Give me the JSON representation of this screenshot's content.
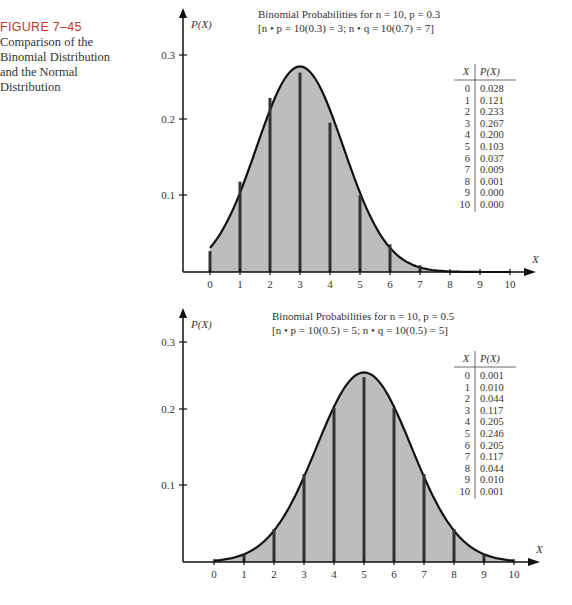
{
  "caption": {
    "figure_label": "FIGURE 7–45",
    "description_lines": [
      "Comparison of the",
      "Binomial Distribution",
      "and the Normal",
      "Distribution"
    ]
  },
  "colors": {
    "fill": "#bdbdbd",
    "line": "#111111",
    "bar": "#333333",
    "figure_label": "#c0392b"
  },
  "chart_data": [
    {
      "type": "bar",
      "title": "Binomial Probabilities for n = 10, p = 0.3",
      "subtitle": "[n • p = 10(0.3) = 3;  n • q = 10(0.7) = 7]",
      "xlabel": "X",
      "ylabel": "P(X)",
      "categories": [
        0,
        1,
        2,
        3,
        4,
        5,
        6,
        7,
        8,
        9,
        10
      ],
      "values": [
        0.028,
        0.121,
        0.233,
        0.267,
        0.2,
        0.103,
        0.037,
        0.009,
        0.001,
        0.0,
        0.0
      ],
      "value_labels": [
        "0.028",
        "0.121",
        "0.233",
        "0.267",
        "0.200",
        "0.103",
        "0.037",
        "0.009",
        "0.001",
        "0.000",
        "0.000"
      ],
      "yticks": [
        "0.1",
        "0.2",
        "0.3"
      ],
      "ylim": [
        0,
        0.33
      ],
      "overlay": {
        "type": "normal_curve",
        "mean": 3,
        "variance": 2.1,
        "shaded": true
      },
      "table": {
        "headers": [
          "X",
          "P(X)"
        ]
      },
      "grid": false
    },
    {
      "type": "bar",
      "title": "Binomial Probabilities for n = 10, p = 0.5",
      "subtitle": "[n • p = 10(0.5) = 5; n • q = 10(0.5) = 5]",
      "xlabel": "X",
      "ylabel": "P(X)",
      "categories": [
        0,
        1,
        2,
        3,
        4,
        5,
        6,
        7,
        8,
        9,
        10
      ],
      "values": [
        0.001,
        0.01,
        0.044,
        0.117,
        0.205,
        0.246,
        0.205,
        0.117,
        0.044,
        0.01,
        0.001
      ],
      "value_labels": [
        "0.001",
        "0.010",
        "0.044",
        "0.117",
        "0.205",
        "0.246",
        "0.205",
        "0.117",
        "0.044",
        "0.010",
        "0.001"
      ],
      "yticks": [
        "0.1",
        "0.2",
        "0.3"
      ],
      "ylim": [
        0,
        0.33
      ],
      "overlay": {
        "type": "normal_curve",
        "mean": 5,
        "variance": 2.5,
        "shaded": true
      },
      "table": {
        "headers": [
          "X",
          "P(X)"
        ]
      },
      "grid": false
    }
  ]
}
